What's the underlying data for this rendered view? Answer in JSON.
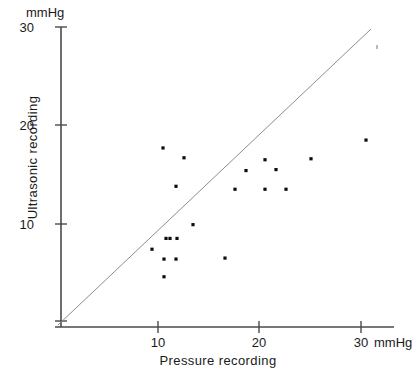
{
  "chart_data": {
    "type": "scatter",
    "title": "",
    "xlabel": "Pressure recording",
    "ylabel": "Ultrasonic recording",
    "x_unit": "mmHg",
    "y_unit": "mmHg",
    "xlim": [
      0,
      31
    ],
    "ylim": [
      0,
      30
    ],
    "grid": false,
    "legend": null,
    "xticks": [
      10,
      20,
      30
    ],
    "yticks": [
      10,
      20,
      30
    ],
    "xtick_labels": [
      "10",
      "20",
      "30"
    ],
    "ytick_labels": [
      "10",
      "20",
      "30"
    ],
    "reference_line": {
      "label": "line of identity",
      "from": [
        0,
        0
      ],
      "to": [
        30.5,
        30.5
      ]
    },
    "points": [
      {
        "x": 10.2,
        "y": 17.7
      },
      {
        "x": 12.3,
        "y": 16.7
      },
      {
        "x": 11.5,
        "y": 13.8
      },
      {
        "x": 13.2,
        "y": 9.9
      },
      {
        "x": 10.5,
        "y": 8.5
      },
      {
        "x": 11.6,
        "y": 8.5
      },
      {
        "x": 10.9,
        "y": 8.5
      },
      {
        "x": 9.1,
        "y": 7.4
      },
      {
        "x": 10.3,
        "y": 6.4
      },
      {
        "x": 11.5,
        "y": 6.4
      },
      {
        "x": 10.3,
        "y": 4.6
      },
      {
        "x": 16.4,
        "y": 6.5
      },
      {
        "x": 17.4,
        "y": 13.5
      },
      {
        "x": 20.4,
        "y": 13.5
      },
      {
        "x": 22.5,
        "y": 13.5
      },
      {
        "x": 20.4,
        "y": 16.5
      },
      {
        "x": 18.5,
        "y": 15.4
      },
      {
        "x": 21.5,
        "y": 15.5
      },
      {
        "x": 25.0,
        "y": 16.6
      },
      {
        "x": 30.5,
        "y": 18.5
      }
    ],
    "n_points": 20
  },
  "axis": {
    "y_unit_label": "mmHg",
    "x_unit_label": "mmHg"
  },
  "colors": {
    "point": "#0d0d0d",
    "axis": "#4a4a4a",
    "identity_line": "#8d8d8d",
    "background": "#ffffff"
  }
}
